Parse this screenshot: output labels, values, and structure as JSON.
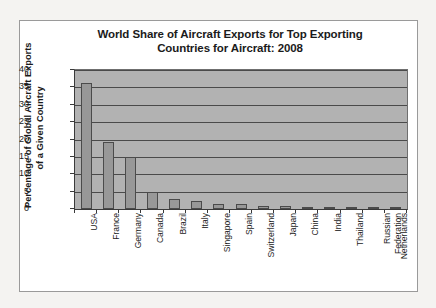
{
  "chart_data": {
    "type": "bar",
    "title": "World Share of Aircraft Exports for Top Exporting Countries for Aircraft: 2008",
    "title_lines": [
      "World Share of Aircraft Exports for Top Exporting",
      "Countries for Aircraft: 2008"
    ],
    "xlabel": "",
    "ylabel": "Percentage of Global Aircraft Exports of a Given Country",
    "ylabel_lines": [
      "Percentage of Global Aircraft Exports",
      "of a Given Country"
    ],
    "ylim": [
      0,
      40
    ],
    "ytick_labels": [
      "40",
      "35",
      "30",
      "25",
      "20",
      "15",
      "10",
      "5",
      "0"
    ],
    "yticks": [
      40,
      35,
      30,
      25,
      20,
      15,
      10,
      5,
      0
    ],
    "grid": true,
    "legend": false,
    "categories": [
      "USA",
      "France",
      "Germany",
      "Canada",
      "Brazil",
      "Italy",
      "Singapore",
      "Spain",
      "Switzerland",
      "Japan",
      "China",
      "India",
      "Thailand",
      "Russian Federation",
      "Netherlands"
    ],
    "values": [
      36.2,
      19.4,
      15.0,
      4.9,
      2.8,
      2.4,
      1.5,
      1.3,
      1.0,
      0.8,
      0.5,
      0.5,
      0.4,
      0.4,
      0.4
    ],
    "colors": {
      "bar_fill": "#989898",
      "bar_edge": "#4b4b4b",
      "plot_background": "#b2b2b2",
      "gridline": "#4a4a4a",
      "axis": "#3a3a3a",
      "panel_background": "#ffffff",
      "panel_border": "#9a9a9a",
      "page_background": "#f4f3f1",
      "text": "#1b1b1b"
    }
  }
}
